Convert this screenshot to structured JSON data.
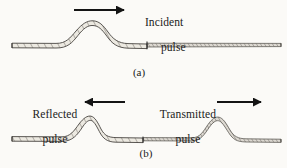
{
  "figure": {
    "kind": "physics-diagram",
    "background_color": "#fbfaf7",
    "ink_color": "#2b2b2b",
    "rope_fill_color": "#e9e6df"
  },
  "panels": [
    {
      "tag": "(a)",
      "tag_x": 139,
      "tag_y": 72,
      "labels": [
        {
          "id": "incident",
          "line1": "Incident",
          "line2": "pulse",
          "x": 133,
          "y": 3
        }
      ],
      "arrows": [
        {
          "id": "incident-arrow",
          "direction": "right",
          "x1": 74,
          "y1": 10,
          "x2": 128,
          "y2": 10
        }
      ],
      "ropes": [
        {
          "id": "heavy-rope-a",
          "thickness": "thick",
          "x_start": 12,
          "x_end": 147,
          "baseline_y": 46
        },
        {
          "id": "light-rope-a",
          "thickness": "thin",
          "x_start": 147,
          "x_end": 281,
          "baseline_y": 45
        }
      ],
      "junction": {
        "id": "junction-a",
        "x": 147,
        "y": 45
      },
      "pulses": [
        {
          "id": "incident-pulse",
          "on": "heavy-rope-a",
          "center_x": 92,
          "peak_y": 22,
          "half_width": 36,
          "polarity": "up"
        }
      ]
    },
    {
      "tag": "(b)",
      "tag_x": 146,
      "tag_y": 153,
      "labels": [
        {
          "id": "reflected",
          "line1": "Reflected",
          "line2": "pulse",
          "x": 18,
          "y": 95
        },
        {
          "id": "transmitted",
          "line1": "Transmitted",
          "line2": "pulse",
          "x": 148,
          "y": 95
        }
      ],
      "arrows": [
        {
          "id": "reflected-arrow",
          "direction": "left",
          "x1": 125,
          "y1": 102,
          "x2": 81,
          "y2": 102
        },
        {
          "id": "transmitted-arrow",
          "direction": "right",
          "x1": 217,
          "y1": 102,
          "x2": 265,
          "y2": 102
        }
      ],
      "ropes": [
        {
          "id": "heavy-rope-b",
          "thickness": "thick",
          "x_start": 12,
          "x_end": 143,
          "baseline_y": 140
        },
        {
          "id": "light-rope-b",
          "thickness": "thin",
          "x_start": 143,
          "x_end": 281,
          "baseline_y": 140
        }
      ],
      "junction": {
        "id": "junction-b",
        "x": 143,
        "y": 140
      },
      "pulses": [
        {
          "id": "reflected-pulse",
          "on": "heavy-rope-b",
          "center_x": 89,
          "peak_y": 118,
          "half_width": 28,
          "polarity": "up"
        },
        {
          "id": "transmitted-pulse",
          "on": "light-rope-b",
          "center_x": 215,
          "peak_y": 117,
          "half_width": 26,
          "polarity": "up"
        }
      ]
    }
  ],
  "text": {
    "incident_line1": "Incident",
    "incident_line2": "pulse",
    "reflected_line1": "Reflected",
    "reflected_line2": "pulse",
    "transmitted_line1": "Transmitted",
    "transmitted_line2": "pulse",
    "panel_a_tag": "(a)",
    "panel_b_tag": "(b)"
  }
}
